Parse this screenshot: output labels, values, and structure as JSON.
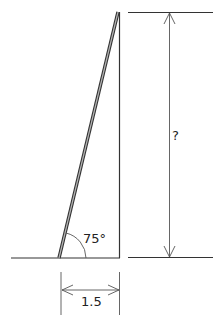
{
  "diagram": {
    "type": "ladder-against-wall",
    "labels": {
      "angle": "75°",
      "height": "?",
      "base": "1.5"
    },
    "colors": {
      "line": "#333333",
      "ladder_fill": "#9a9a9a",
      "dimension": "#555555"
    }
  }
}
